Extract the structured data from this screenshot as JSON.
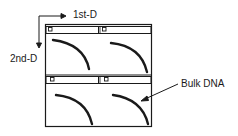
{
  "diagram": {
    "axis_first_dimension_label": "1st-D",
    "axis_second_dimension_label": "2nd-D",
    "annotation_label": "Bulk DNA",
    "panels": [
      {
        "position": "top-left",
        "well": "sample-well",
        "feature": "bulk-dna-arc"
      },
      {
        "position": "top-right",
        "well": "sample-well",
        "feature": "bulk-dna-arc"
      },
      {
        "position": "bottom-left",
        "well": "sample-well",
        "feature": "bulk-dna-arc"
      },
      {
        "position": "bottom-right",
        "well": "sample-well",
        "feature": "bulk-dna-arc"
      }
    ],
    "colors": {
      "stroke": "#1a1a1a",
      "background": "#ffffff"
    }
  }
}
